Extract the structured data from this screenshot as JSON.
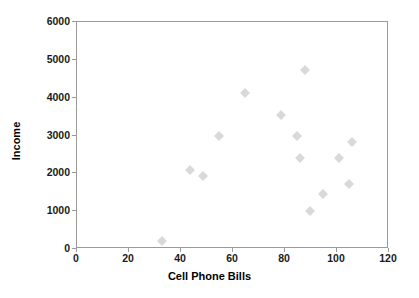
{
  "chart_data": {
    "type": "scatter",
    "title": "",
    "xlabel": "Cell Phone Bills",
    "ylabel": "Income",
    "xlim": [
      0,
      120
    ],
    "ylim": [
      0,
      6000
    ],
    "xticks": [
      0,
      20,
      40,
      60,
      80,
      100,
      120
    ],
    "yticks": [
      0,
      1000,
      2000,
      3000,
      4000,
      5000,
      6000
    ],
    "grid": false,
    "legend": false,
    "marker": {
      "shape": "diamond",
      "color": "#d9d9d9",
      "size": 7
    },
    "series": [
      {
        "name": "Income vs Cell Phone Bills",
        "points": [
          {
            "x": 33,
            "y": 190
          },
          {
            "x": 44,
            "y": 2070
          },
          {
            "x": 49,
            "y": 1900
          },
          {
            "x": 55,
            "y": 2960
          },
          {
            "x": 65,
            "y": 4110
          },
          {
            "x": 79,
            "y": 3520
          },
          {
            "x": 85,
            "y": 2970
          },
          {
            "x": 86,
            "y": 2390
          },
          {
            "x": 88,
            "y": 4710
          },
          {
            "x": 90,
            "y": 970
          },
          {
            "x": 95,
            "y": 1440
          },
          {
            "x": 101,
            "y": 2380
          },
          {
            "x": 105,
            "y": 1690
          },
          {
            "x": 106,
            "y": 2810
          }
        ]
      }
    ]
  },
  "axes": {
    "x_tick_labels": [
      "0",
      "20",
      "40",
      "60",
      "80",
      "100",
      "120"
    ],
    "y_tick_labels": [
      "0",
      "1000",
      "2000",
      "3000",
      "4000",
      "5000",
      "6000"
    ],
    "x_axis_title": "Cell Phone Bills",
    "y_axis_title": "Income"
  },
  "colors": {
    "marker": "#d9d9d9",
    "frame": "#9a9a9a",
    "text": "#000000",
    "background": "#ffffff"
  }
}
